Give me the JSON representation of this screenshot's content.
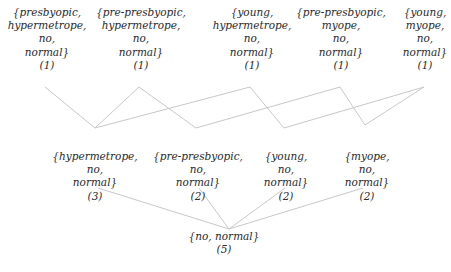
{
  "diagram": {
    "title": "",
    "edge_color": "#c8c8c8",
    "text_color": "#2a2a2a",
    "levels": [
      {
        "name": "level-4",
        "nodes": [
          {
            "id": "n1",
            "lines": [
              "{presbyopic,",
              "hypermetrope,",
              "no,",
              "normal}"
            ],
            "count": "(1)",
            "x": 47,
            "y": 6
          },
          {
            "id": "n2",
            "lines": [
              "{pre-presbyopic,",
              "hypermetrope,",
              "no,",
              "normal}"
            ],
            "count": "(1)",
            "x": 141,
            "y": 6
          },
          {
            "id": "n3",
            "lines": [
              "{young,",
              "hypermetrope,",
              "no,",
              "normal}"
            ],
            "count": "(1)",
            "x": 252,
            "y": 6
          },
          {
            "id": "n4",
            "lines": [
              "{pre-presbyopic,",
              "myope,",
              "no,",
              "normal}"
            ],
            "count": "(1)",
            "x": 341,
            "y": 6
          },
          {
            "id": "n5",
            "lines": [
              "{young,",
              "myope,",
              "no,",
              "normal}"
            ],
            "count": "(1)",
            "x": 425,
            "y": 6
          }
        ]
      },
      {
        "name": "level-3",
        "nodes": [
          {
            "id": "m1",
            "lines": [
              "{hypermetrope,",
              "no,",
              "normal}"
            ],
            "count": "(3)",
            "x": 95,
            "y": 150
          },
          {
            "id": "m2",
            "lines": [
              "{pre-presbyopic,",
              "no,",
              "normal}"
            ],
            "count": "(2)",
            "x": 198,
            "y": 150
          },
          {
            "id": "m3",
            "lines": [
              "{young,",
              "no,",
              "normal}"
            ],
            "count": "(2)",
            "x": 286,
            "y": 150
          },
          {
            "id": "m4",
            "lines": [
              "{myope,",
              "no,",
              "normal}"
            ],
            "count": "(2)",
            "x": 367,
            "y": 150
          }
        ]
      },
      {
        "name": "level-2",
        "nodes": [
          {
            "id": "b1",
            "lines": [
              "{no, normal}"
            ],
            "count": "(5)",
            "x": 224,
            "y": 230
          }
        ]
      }
    ],
    "edges": [
      {
        "from": "n1",
        "to": "m1",
        "x1": 45,
        "y1": 87,
        "x2": 95,
        "y2": 128
      },
      {
        "from": "n2",
        "to": "m1",
        "x1": 139,
        "y1": 87,
        "x2": 95,
        "y2": 128
      },
      {
        "from": "n2",
        "to": "m2",
        "x1": 139,
        "y1": 87,
        "x2": 196,
        "y2": 128
      },
      {
        "from": "n3",
        "to": "m1",
        "x1": 250,
        "y1": 87,
        "x2": 95,
        "y2": 128
      },
      {
        "from": "n3",
        "to": "m3",
        "x1": 250,
        "y1": 87,
        "x2": 284,
        "y2": 128
      },
      {
        "from": "n4",
        "to": "m2",
        "x1": 340,
        "y1": 87,
        "x2": 196,
        "y2": 128
      },
      {
        "from": "n4",
        "to": "m4",
        "x1": 340,
        "y1": 87,
        "x2": 365,
        "y2": 125
      },
      {
        "from": "n5",
        "to": "m3",
        "x1": 424,
        "y1": 87,
        "x2": 284,
        "y2": 128
      },
      {
        "from": "n5",
        "to": "m4",
        "x1": 424,
        "y1": 87,
        "x2": 365,
        "y2": 125
      },
      {
        "from": "m1",
        "to": "b1",
        "x1": 98,
        "y1": 188,
        "x2": 229,
        "y2": 229
      },
      {
        "from": "m2",
        "to": "b1",
        "x1": 199,
        "y1": 188,
        "x2": 229,
        "y2": 229
      },
      {
        "from": "m3",
        "to": "b1",
        "x1": 285,
        "y1": 188,
        "x2": 229,
        "y2": 229
      },
      {
        "from": "m4",
        "to": "b1",
        "x1": 363,
        "y1": 188,
        "x2": 229,
        "y2": 229
      }
    ]
  }
}
